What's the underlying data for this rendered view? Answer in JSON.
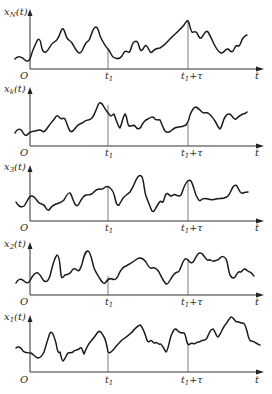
{
  "figure": {
    "panels": [
      {
        "id": "xN",
        "ylabel": "x",
        "ylabel_sub": "N",
        "ylabel_suffix": "(t)",
        "origin": "O",
        "t1_label_main": "t",
        "t1_label_sub": "1",
        "t1tau_label_main": "t",
        "t1tau_label_sub": "1",
        "t1tau_label_suffix": "+τ",
        "t_label": "t"
      },
      {
        "id": "xk",
        "ylabel": "x",
        "ylabel_sub": "k",
        "ylabel_suffix": "(t)",
        "origin": "O",
        "t1_label_main": "t",
        "t1_label_sub": "1",
        "t1tau_label_main": "t",
        "t1tau_label_sub": "1",
        "t1tau_label_suffix": "+τ",
        "t_label": "t"
      },
      {
        "id": "x3",
        "ylabel": "x",
        "ylabel_sub": "3",
        "ylabel_suffix": "(t)",
        "origin": "O",
        "t1_label_main": "t",
        "t1_label_sub": "1",
        "t1tau_label_main": "t",
        "t1tau_label_sub": "1",
        "t1tau_label_suffix": "+τ",
        "t_label": "t"
      },
      {
        "id": "x2",
        "ylabel": "x",
        "ylabel_sub": "2",
        "ylabel_suffix": "(t)",
        "origin": "O",
        "t1_label_main": "t",
        "t1_label_sub": "1",
        "t1tau_label_main": "t",
        "t1tau_label_sub": "1",
        "t1tau_label_suffix": "+τ",
        "t_label": "t"
      },
      {
        "id": "x1",
        "ylabel": "x",
        "ylabel_sub": "1",
        "ylabel_suffix": "(t)",
        "origin": "O",
        "t1_label_main": "t",
        "t1_label_sub": "1",
        "t1tau_label_main": "t",
        "t1tau_label_sub": "1",
        "t1tau_label_suffix": "+τ",
        "t_label": "t"
      }
    ]
  }
}
